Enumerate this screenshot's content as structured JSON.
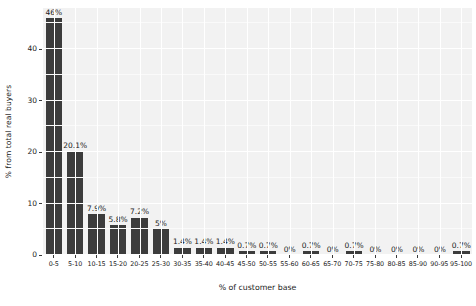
{
  "chart_data": {
    "type": "bar",
    "title": "",
    "xlabel": "% of customer base",
    "ylabel": "% from total real buyers",
    "categories": [
      "0-5",
      "5-10",
      "10-15",
      "15-20",
      "20-25",
      "25-30",
      "30-35",
      "35-40",
      "40-45",
      "45-50",
      "50-55",
      "55-60",
      "60-65",
      "65-70",
      "70-75",
      "75-80",
      "80-85",
      "85-90",
      "90-95",
      "95-100"
    ],
    "values": [
      46,
      20.1,
      7.9,
      5.8,
      7.2,
      5,
      1.4,
      1.4,
      1.4,
      0.7,
      0.7,
      0,
      0.7,
      0,
      0.7,
      0,
      0,
      0,
      0,
      0.7
    ],
    "data_labels": [
      "46%",
      "20.1%",
      "7.9%",
      "5.8%",
      "7.2%",
      "5%",
      "1.4%",
      "1.4%",
      "1.4%",
      "0.7%",
      "0.7%",
      "0%",
      "0.7%",
      "0%",
      "0.7%",
      "0%",
      "0%",
      "0%",
      "0%",
      "0.7%"
    ],
    "ylim": [
      0,
      48
    ],
    "yticks": [
      0,
      10,
      20,
      30,
      40
    ],
    "ytick_labels": [
      "0",
      "10",
      "20",
      "30",
      "40"
    ],
    "grid": true,
    "legend": false,
    "bar_color": "#3c3c3c",
    "panel_color": "#f2f2f2",
    "gridline_color": "#ffffff"
  }
}
